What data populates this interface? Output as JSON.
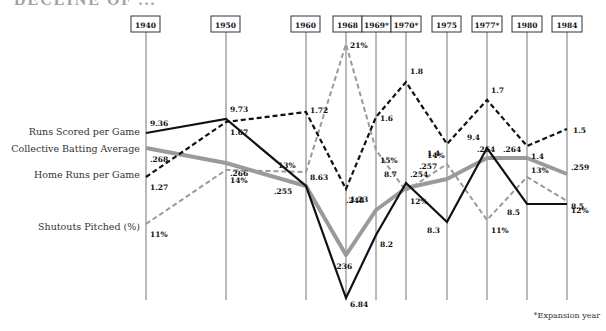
{
  "page": {
    "title_fragment": "DECLINE OF ...",
    "footnote": "*Expansion year"
  },
  "chart_data": {
    "type": "line",
    "title": "",
    "xlabel": "",
    "ylabel": "",
    "grid": "vertical year lines only",
    "legend_position": "left, labels aligned with first data point",
    "categories": [
      "1940",
      "1950",
      "1960",
      "1968",
      "1969*",
      "1970*",
      "1975",
      "1977*",
      "1980",
      "1984"
    ],
    "series": [
      {
        "name": "Runs Scored per Game",
        "style": "solid-black",
        "color": "#111111",
        "values": [
          9.36,
          9.73,
          8.63,
          6.84,
          8.2,
          8.7,
          8.3,
          9.4,
          8.5,
          8.5
        ],
        "labels": [
          "9.36",
          "9.73",
          "8.63",
          "6.84",
          "8.2",
          "8.7",
          "8.3",
          "9.4",
          "8.5",
          "8.5"
        ]
      },
      {
        "name": "Collective Batting Average",
        "style": "thick-solid-gray",
        "color": "#9a9a9a",
        "values": [
          0.268,
          0.266,
          0.255,
          0.236,
          0.248,
          0.254,
          0.257,
          0.264,
          0.264,
          0.259
        ],
        "labels": [
          ".268",
          ".266",
          ".255",
          ".236",
          ".248",
          ".254",
          ".257",
          ".264",
          ".264",
          ".259"
        ]
      },
      {
        "name": "Home Runs per Game",
        "style": "dashed-black",
        "color": "#111111",
        "values": [
          1.27,
          1.67,
          1.72,
          1.23,
          1.6,
          1.8,
          1.4,
          1.7,
          1.4,
          1.5
        ],
        "labels": [
          "1.27",
          "1.67",
          "1.72",
          "1.23",
          "1.6",
          "1.8",
          "1.4",
          "1.7",
          "1.4",
          "1.5"
        ]
      },
      {
        "name": "Shutouts Pitched (%)",
        "style": "dashed-gray",
        "color": "#9a9a9a",
        "values": [
          11,
          14,
          13,
          21,
          15,
          12,
          14,
          11,
          13,
          12
        ],
        "labels": [
          "11%",
          "14%",
          "13%",
          "21%",
          "15%",
          "12%",
          "14%",
          "11%",
          "13%",
          "12%"
        ]
      }
    ],
    "annotations": [
      "*Expansion year"
    ]
  },
  "layout": {
    "x_positions": [
      146,
      226,
      306,
      346,
      376,
      406,
      447,
      487,
      527,
      567
    ],
    "box_rects": [
      [
        131,
        16,
        29
      ],
      [
        211,
        16,
        29
      ],
      [
        291,
        16,
        29
      ],
      [
        333,
        16,
        29
      ],
      [
        362,
        16,
        29
      ],
      [
        391,
        16,
        30
      ],
      [
        432,
        16,
        29
      ],
      [
        472,
        16,
        30
      ],
      [
        512,
        16,
        30
      ],
      [
        552,
        16,
        30
      ]
    ],
    "line_bottom": 300,
    "points": {
      "Runs Scored per Game": [
        133,
        119,
        186,
        298,
        235,
        183,
        222,
        148,
        204,
        204
      ],
      "Collective Batting Average": [
        148,
        163,
        186,
        255,
        210,
        188,
        179,
        158,
        158,
        174
      ],
      "Home Runs per Game": [
        177,
        122,
        112,
        189,
        117,
        82,
        144,
        100,
        146,
        129
      ],
      "Shutouts Pitched (%)": [
        224,
        170,
        172,
        44,
        150,
        191,
        164,
        220,
        177,
        201
      ]
    },
    "label_offsets": {
      "Runs Scored per Game": [
        [
          4,
          -7
        ],
        [
          4,
          -7
        ],
        [
          4,
          -6
        ],
        [
          4,
          9
        ],
        [
          4,
          12
        ],
        [
          -22,
          -6
        ],
        [
          -20,
          11
        ],
        [
          -20,
          -8
        ],
        [
          -20,
          11
        ],
        [
          4,
          5
        ]
      ],
      "Collective Batting Average": [
        [
          4,
          14
        ],
        [
          4,
          13
        ],
        [
          -32,
          8
        ],
        [
          -12,
          14
        ],
        [
          -30,
          -7
        ],
        [
          4,
          -11
        ],
        [
          -28,
          -10
        ],
        [
          -10,
          -6
        ],
        [
          -24,
          -6
        ],
        [
          4,
          -4
        ]
      ],
      "Home Runs per Game": [
        [
          4,
          13
        ],
        [
          4,
          13
        ],
        [
          4,
          1
        ],
        [
          4,
          13
        ],
        [
          4,
          4
        ],
        [
          4,
          -8
        ],
        [
          -20,
          12
        ],
        [
          4,
          -7
        ],
        [
          4,
          13
        ],
        [
          6,
          4
        ]
      ],
      "Shutouts Pitched (%)": [
        [
          4,
          13
        ],
        [
          4,
          13
        ],
        [
          -28,
          -4
        ],
        [
          4,
          4
        ],
        [
          4,
          13
        ],
        [
          4,
          13
        ],
        [
          -20,
          -6
        ],
        [
          4,
          13
        ],
        [
          4,
          -4
        ],
        [
          4,
          12
        ]
      ]
    }
  },
  "legend_labels": [
    {
      "text": "Runs Scored per Game",
      "y": 135
    },
    {
      "text": "Collective Batting Average",
      "y": 152
    },
    {
      "text": "Home Runs per Game",
      "y": 178
    },
    {
      "text": "Shutouts Pitched (%)",
      "y": 230
    }
  ]
}
